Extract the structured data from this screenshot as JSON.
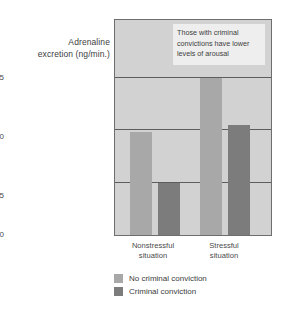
{
  "chart_data": {
    "type": "bar",
    "title": "",
    "xlabel": "",
    "ylabel": "Adrenaline excretion (ng/min.)",
    "ylabel_line1": "Adrenaline",
    "ylabel_line2": "excretion (ng/min.)",
    "categories": [
      "Nonstressful situation",
      "Stressful situation"
    ],
    "category_lines": [
      [
        "Nonstressful",
        "situation"
      ],
      [
        "Stressful",
        "situation"
      ]
    ],
    "series": [
      {
        "name": "No criminal conviction",
        "values": [
          9.8,
          15.0
        ],
        "color": "#a8a8a8"
      },
      {
        "name": "Criminal conviction",
        "values": [
          5.0,
          10.5
        ],
        "color": "#7c7c7c"
      }
    ],
    "ylim": [
      0,
      20.5
    ],
    "yticks": [
      0,
      5,
      10,
      15
    ],
    "ytick_labels": [
      "0",
      "5",
      "10",
      "15"
    ],
    "grid": true,
    "legend_position": "bottom-left",
    "annotations": [
      {
        "text": "Those with criminal convictions have lower levels of arousal",
        "lines": [
          "Those with criminal",
          "convictions have lower",
          "levels of arousal"
        ]
      }
    ],
    "plot_background": "#d2d2d2",
    "axis_color": "#6e6e6e"
  }
}
